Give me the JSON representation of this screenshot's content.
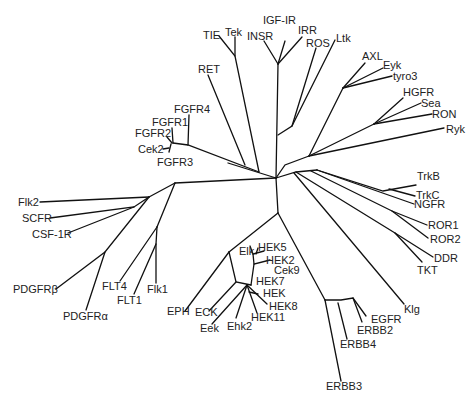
{
  "diagram": {
    "type": "unrooted phylogenetic tree",
    "line_color": "#111111",
    "text_color": "#222222",
    "background": "#ffffff"
  },
  "labels": {
    "TIE": "TIE",
    "Tek": "Tek",
    "INSR": "INSR",
    "IGF_IR": "IGF-IR",
    "IRR": "IRR",
    "ROS": "ROS",
    "Ltk": "Ltk",
    "AXL": "AXL",
    "Eyk": "Eyk",
    "tyro3": "tyro3",
    "HGFR": "HGFR",
    "Sea": "Sea",
    "RON": "RON",
    "Ryk": "Ryk",
    "RET": "RET",
    "FGFR4": "FGFR4",
    "FGFR1": "FGFR1",
    "FGFR2": "FGFR2",
    "Cek2": "Cek2",
    "FGFR3": "FGFR3",
    "TrkB": "TrkB",
    "TrkC": "TrkC",
    "NGFR": "NGFR",
    "ROR1": "ROR1",
    "ROR2": "ROR2",
    "DDR": "DDR",
    "TKT": "TKT",
    "Flk2": "Flk2",
    "SCFR": "SCFR",
    "CSF_1R": "CSF-1R",
    "PDGFRb": "PDGFRβ",
    "PDGFRa": "PDGFRα",
    "FLT4": "FLT4",
    "FLT1": "FLT1",
    "Flk1": "Flk1",
    "EPH": "EPH",
    "ECK": "ECK",
    "Eek": "Eek",
    "Ehk2": "Ehk2",
    "Elk": "Elk",
    "HEK5": "HEK5",
    "HEK2": "HEK2",
    "Cek9": "Cek9",
    "HEK7": "HEK7",
    "HEK": "HEK",
    "HEK8": "HEK8",
    "HEK11": "HEK11",
    "Klg": "Klg",
    "EGFR": "EGFR",
    "ERBB2": "ERBB2",
    "ERBB4": "ERBB4",
    "ERBB3": "ERBB3"
  },
  "clades": [
    {
      "name": "Insulin receptor",
      "members": [
        "INSR",
        "IGF-IR",
        "IRR"
      ]
    },
    {
      "name": "ROS/Ltk",
      "members": [
        "ROS",
        "Ltk"
      ]
    },
    {
      "name": "TIE",
      "members": [
        "TIE",
        "Tek"
      ]
    },
    {
      "name": "AXL",
      "members": [
        "AXL",
        "Eyk",
        "tyro3"
      ]
    },
    {
      "name": "HGFR",
      "members": [
        "HGFR",
        "Sea",
        "RON"
      ]
    },
    {
      "name": "Ryk",
      "members": [
        "Ryk"
      ]
    },
    {
      "name": "RET",
      "members": [
        "RET"
      ]
    },
    {
      "name": "FGFR",
      "members": [
        "FGFR4",
        "FGFR1",
        "FGFR2",
        "Cek2",
        "FGFR3"
      ]
    },
    {
      "name": "Trk",
      "members": [
        "TrkB",
        "TrkC",
        "NGFR"
      ]
    },
    {
      "name": "ROR",
      "members": [
        "ROR1",
        "ROR2"
      ]
    },
    {
      "name": "DDR",
      "members": [
        "DDR",
        "TKT"
      ]
    },
    {
      "name": "PDGFR",
      "members": [
        "Flk2",
        "SCFR",
        "CSF-1R",
        "PDGFRβ",
        "PDGFRα"
      ]
    },
    {
      "name": "VEGFR",
      "members": [
        "FLT4",
        "FLT1",
        "Flk1"
      ]
    },
    {
      "name": "EPH",
      "members": [
        "EPH",
        "ECK",
        "Eek",
        "Ehk2",
        "Elk",
        "HEK5",
        "HEK2",
        "Cek9",
        "HEK7",
        "HEK",
        "HEK8",
        "HEK11"
      ]
    },
    {
      "name": "Klg",
      "members": [
        "Klg"
      ]
    },
    {
      "name": "EGFR",
      "members": [
        "EGFR",
        "ERBB2",
        "ERBB4",
        "ERBB3"
      ]
    }
  ]
}
